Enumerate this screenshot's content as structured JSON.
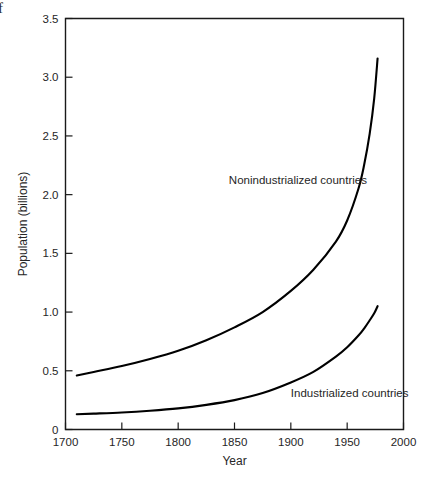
{
  "figure": {
    "edge_glyph": "f",
    "background_color": "#ffffff",
    "line_color": "#000000",
    "text_color": "#262626"
  },
  "chart_data": {
    "type": "line",
    "title": "",
    "xlabel": "Year",
    "ylabel": "Population (billions)",
    "xlim": [
      1700,
      2000
    ],
    "ylim": [
      0,
      3.5
    ],
    "grid": false,
    "legend_position": "inline-annotation",
    "xticks": [
      1700,
      1750,
      1800,
      1850,
      1900,
      1950,
      2000
    ],
    "xtick_labels": [
      "1700",
      "1750",
      "1800",
      "1850",
      "1900",
      "1950",
      "2000"
    ],
    "yticks": [
      0,
      0.5,
      1.0,
      1.5,
      2.0,
      2.5,
      3.0,
      3.5
    ],
    "ytick_labels": [
      "0",
      "0.5",
      "1.0",
      "1.5",
      "2.0",
      "2.5",
      "3.0",
      "3.5"
    ],
    "annotations": [
      {
        "text": "Nonindustrialized countries",
        "x": 1845,
        "y": 2.09
      },
      {
        "text": "Industrialized countries",
        "x": 1900,
        "y": 0.28
      }
    ],
    "series": [
      {
        "name": "Nonindustrialized countries",
        "x": [
          1710,
          1725,
          1750,
          1775,
          1800,
          1825,
          1850,
          1875,
          1900,
          1920,
          1940,
          1950,
          1960,
          1965,
          1970,
          1974,
          1977
        ],
        "values": [
          0.46,
          0.49,
          0.54,
          0.6,
          0.67,
          0.76,
          0.87,
          1.0,
          1.18,
          1.36,
          1.6,
          1.78,
          2.05,
          2.25,
          2.52,
          2.82,
          3.16
        ]
      },
      {
        "name": "Industrialized countries",
        "x": [
          1710,
          1725,
          1750,
          1775,
          1800,
          1825,
          1850,
          1875,
          1900,
          1920,
          1940,
          1950,
          1960,
          1965,
          1970,
          1974,
          1977
        ],
        "values": [
          0.13,
          0.135,
          0.145,
          0.16,
          0.18,
          0.21,
          0.25,
          0.31,
          0.4,
          0.49,
          0.62,
          0.7,
          0.8,
          0.86,
          0.93,
          0.99,
          1.05
        ]
      }
    ]
  }
}
